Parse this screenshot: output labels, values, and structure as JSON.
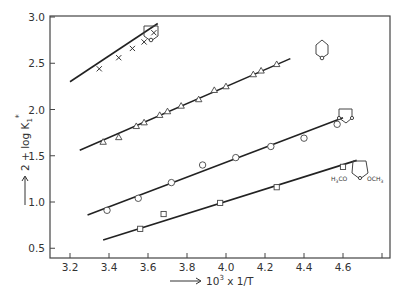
{
  "chart_data": {
    "type": "scatter",
    "title": "",
    "xlabel": "10³ x 1/T",
    "ylabel": "2 + log K₁*",
    "xlim": [
      3.1,
      4.85
    ],
    "ylim": [
      0.4,
      3.0
    ],
    "grid": false,
    "x_ticks": [
      "3.2",
      "3.4",
      "3.6",
      "3.8",
      "4.0",
      "4.2",
      "4.4",
      "4.6"
    ],
    "y_ticks": [
      "0.5",
      "1.0",
      "1.5",
      "2.0",
      "2.5",
      "3.0"
    ],
    "series": [
      {
        "name": "tetrahydrofuran",
        "marker": "x",
        "structure_label": "THF ring (5-membered, O)",
        "points": [
          [
            3.35,
            2.44
          ],
          [
            3.45,
            2.56
          ],
          [
            3.52,
            2.66
          ],
          [
            3.58,
            2.73
          ],
          [
            3.63,
            2.83
          ]
        ],
        "fit_line": [
          [
            3.2,
            2.3
          ],
          [
            3.65,
            2.93
          ]
        ]
      },
      {
        "name": "tetrahydropyran",
        "marker": "triangle",
        "structure_label": "THP ring (6-membered, O)",
        "points": [
          [
            3.37,
            1.65
          ],
          [
            3.45,
            1.7
          ],
          [
            3.54,
            1.82
          ],
          [
            3.58,
            1.86
          ],
          [
            3.66,
            1.94
          ],
          [
            3.7,
            1.98
          ],
          [
            3.77,
            2.04
          ],
          [
            3.86,
            2.11
          ],
          [
            3.94,
            2.21
          ],
          [
            4.0,
            2.25
          ],
          [
            4.14,
            2.38
          ],
          [
            4.18,
            2.42
          ],
          [
            4.26,
            2.49
          ]
        ],
        "fit_line": [
          [
            3.25,
            1.56
          ],
          [
            4.33,
            2.55
          ]
        ]
      },
      {
        "name": "1,3-dioxolane",
        "marker": "circle",
        "structure_label": "1,3-dioxolane ring",
        "points": [
          [
            3.39,
            0.91
          ],
          [
            3.55,
            1.04
          ],
          [
            3.72,
            1.21
          ],
          [
            3.88,
            1.4
          ],
          [
            4.05,
            1.48
          ],
          [
            4.23,
            1.6
          ],
          [
            4.4,
            1.69
          ],
          [
            4.57,
            1.84
          ]
        ],
        "fit_line": [
          [
            3.29,
            0.86
          ],
          [
            4.6,
            1.91
          ]
        ]
      },
      {
        "name": "2,5-dimethoxytetrahydrofuran",
        "marker": "square",
        "structure_label": "H3CO-ring-OCH3",
        "points": [
          [
            3.56,
            0.71
          ],
          [
            3.68,
            0.87
          ],
          [
            3.97,
            0.99
          ],
          [
            4.26,
            1.16
          ],
          [
            4.6,
            1.38
          ]
        ],
        "fit_line": [
          [
            3.37,
            0.59
          ],
          [
            4.67,
            1.45
          ]
        ]
      }
    ],
    "annotations": [
      {
        "text": "H3CO",
        "near": "dimethoxy structure"
      },
      {
        "text": "OCH3",
        "near": "dimethoxy structure"
      }
    ]
  },
  "axis": {
    "x_title_prefix": "10",
    "x_title_exp": "3",
    "x_title_suffix": " x 1/T",
    "y_title_main": "2 + log K",
    "y_title_sub": "1",
    "y_title_sup": "*"
  },
  "structures": {
    "methoxy_left": "H",
    "methoxy_left_sub": "3",
    "methoxy_left_tail": "CO",
    "methoxy_right": "OCH",
    "methoxy_right_sub": "3"
  }
}
